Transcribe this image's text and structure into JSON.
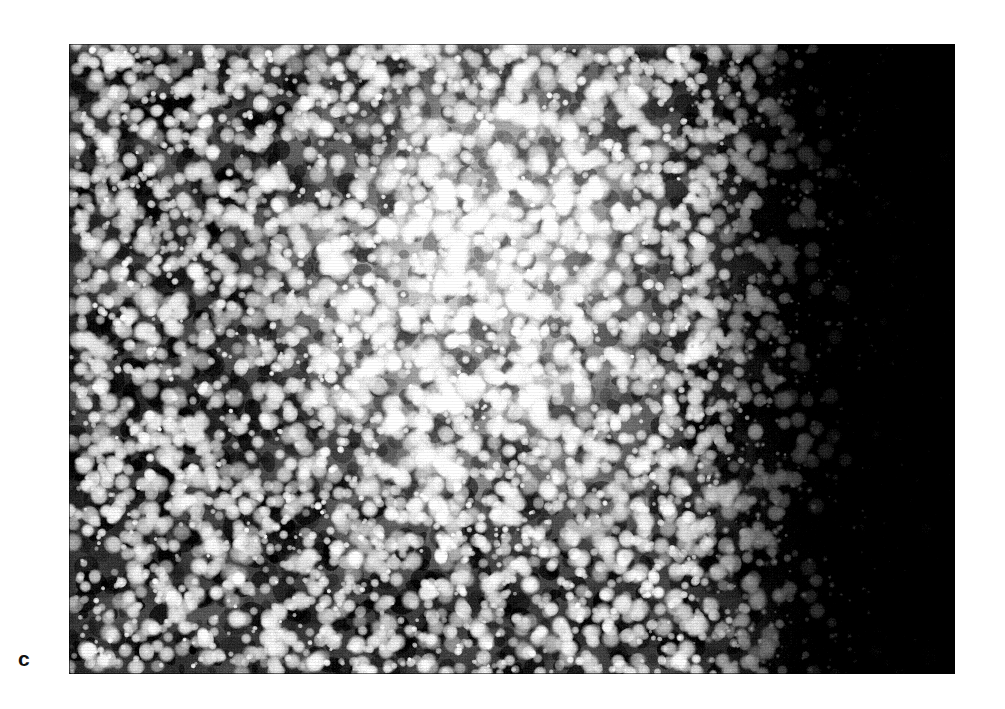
{
  "figure": {
    "panel_label": "c",
    "caption": "",
    "background_color": "#ffffff"
  },
  "micrograph": {
    "alt_name": "scanning-electron-micrograph",
    "description": "Grainy black-and-white micrograph of densely packed bright particulate grains fading into a featureless dark field toward the right edge.",
    "x": 69,
    "y": 44,
    "width": 886,
    "height": 630,
    "colors": {
      "background": "#000000",
      "particles": "#ffffff",
      "midtone": "#8a8a8a",
      "dark_field": "#050505"
    },
    "regions": [
      {
        "name": "left-particulate-field",
        "tone": "dark-with-dense-bright-grains"
      },
      {
        "name": "center-bright-zone",
        "tone": "washed-out-bright-aggregate"
      },
      {
        "name": "right-transition",
        "tone": "sparse-bright-specks"
      },
      {
        "name": "right-dark-field",
        "tone": "near-solid-black"
      }
    ],
    "grain": {
      "particle_count": 5200,
      "speck_count": 900,
      "min_radius": 2,
      "max_radius": 11,
      "halftone_pitch": 3
    },
    "brightness_profile": {
      "note": "Illumination falls off strongly to the right; a diffuse bright lobe is centered left-of-middle.",
      "bright_lobe_center_x_frac": 0.46,
      "bright_lobe_center_y_frac": 0.42,
      "bright_lobe_radius_x_frac": 0.3,
      "bright_lobe_radius_y_frac": 0.52,
      "dark_onset_x_frac": 0.7,
      "dark_full_x_frac": 0.9
    }
  }
}
